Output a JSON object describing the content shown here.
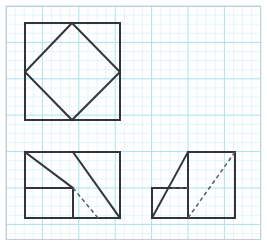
{
  "canvas": {
    "width": 267,
    "height": 246,
    "background_color": "#ffffff",
    "border_color": "#c9cdcf",
    "title": "Graph paper worksheet with three geometric figures"
  },
  "grid": {
    "minor_cell_px": 9.1,
    "minor_color": "#d8f1f7",
    "major_every": 4,
    "major_color": "#a9e2ef",
    "minor_width": 0.7,
    "major_width": 1.0,
    "origin_x": 6,
    "origin_y": 6,
    "area_width": 255,
    "area_height": 234,
    "visible": true
  },
  "style": {
    "stroke_color": "#33333a",
    "stroke_width": 2.0,
    "dashed_color": "#5a5a62",
    "dashed_width": 1.5,
    "dash_pattern": "4 3"
  },
  "figures": [
    {
      "id": "top-left-inscribed-square",
      "name": "square-with-inscribed-tilted-square",
      "description": "A square with a rotated square inscribed so its vertices touch the outer square's sides",
      "outer_square": {
        "x": 25,
        "y": 23,
        "width": 95,
        "height": 97,
        "points": "25,23 120,23 120,120 25,120"
      },
      "inner_square": {
        "points": "72,23 120,72 72,120 25,72",
        "vertices": [
          {
            "label": "top",
            "x": 72,
            "y": 23
          },
          {
            "label": "right",
            "x": 120,
            "y": 72
          },
          {
            "label": "bottom",
            "x": 72,
            "y": 120
          },
          {
            "label": "left",
            "x": 25,
            "y": 72
          }
        ]
      }
    },
    {
      "id": "bottom-left-rectangle",
      "name": "rectangle-with-parallel-diagonals",
      "description": "A rectangle containing two parallel solid diagonals, an inner small rectangle, and a dashed diagonal continuation",
      "outer_rect": {
        "x": 25,
        "y": 152,
        "width": 95,
        "height": 66,
        "points": "25,152 120,152 120,218 25,218"
      },
      "inner_rect": {
        "x": 25,
        "y": 188,
        "width": 48,
        "height": 30,
        "points": "25,188 73,188 73,218"
      },
      "solid_lines": [
        {
          "name": "upper-left-diagonal",
          "x1": 25,
          "y1": 152,
          "x2": 73,
          "y2": 188
        },
        {
          "name": "main-diagonal",
          "x1": 73,
          "y1": 152,
          "x2": 120,
          "y2": 218
        },
        {
          "name": "inner-rect-top",
          "x1": 25,
          "y1": 188,
          "x2": 73,
          "y2": 188
        },
        {
          "name": "inner-rect-right",
          "x1": 73,
          "y1": 188,
          "x2": 73,
          "y2": 218
        }
      ],
      "dashed_lines": [
        {
          "name": "hidden-diagonal",
          "x1": 73,
          "y1": 188,
          "x2": 98,
          "y2": 218
        }
      ]
    },
    {
      "id": "bottom-right-lshape",
      "name": "l-shape-with-diagonals",
      "description": "An L-shaped figure of a small square and a tall square, with a solid diagonal on the left and a dashed hidden diagonal on the right",
      "outline": {
        "points": "152,188 152,218 235,218 235,152 188,152 188,188"
      },
      "solid_lines": [
        {
          "name": "left-diagonal",
          "x1": 152,
          "y1": 218,
          "x2": 188,
          "y2": 152
        },
        {
          "name": "middle-vertical",
          "x1": 188,
          "y1": 152,
          "x2": 188,
          "y2": 218
        }
      ],
      "dashed_lines": [
        {
          "name": "hidden-diagonal",
          "x1": 188,
          "y1": 218,
          "x2": 235,
          "y2": 152
        },
        {
          "name": "hidden-horizontal",
          "x1": 172,
          "y1": 188,
          "x2": 188,
          "y2": 188
        }
      ]
    }
  ]
}
